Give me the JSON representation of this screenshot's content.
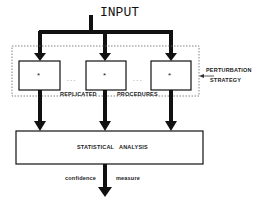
{
  "diagram": {
    "input_label": "INPUT",
    "procedure_marker": "*",
    "ellipsis": ". . .",
    "group_labels": [
      "REPLICATED",
      "PROCEDURES"
    ],
    "side_labels": [
      "PERTURBATION",
      "STRATEGY"
    ],
    "analysis_label": "STATISTICAL   ANALYSIS",
    "output_labels": [
      "confidence",
      "measure"
    ],
    "colors": {
      "line": "#111111",
      "background": "#ffffff",
      "dotted": "#555555"
    }
  }
}
